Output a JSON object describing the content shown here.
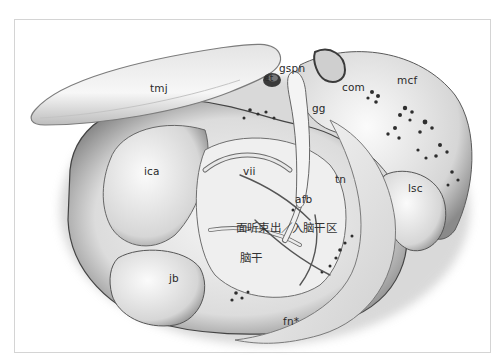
{
  "figure": {
    "type": "anatomical illustration",
    "view": "translabyrinthine / middle fossa exposure of facial-vestibulocochlear nerve at brainstem",
    "colors": {
      "background": "#ffffff",
      "frame": "#d4d4d4",
      "tissue_light": "#f2f2f2",
      "tissue_mid": "#b8b8b8",
      "tissue_dark": "#3a3a3a",
      "label_text": "#2a2a2a"
    }
  },
  "labels": {
    "tmj": "tmj",
    "gspn": "gspn",
    "et": "et",
    "gg": "gg",
    "com": "com",
    "mcf": "mcf",
    "ica": "ica",
    "vii": "vii",
    "afb": "afb",
    "tn": "tn",
    "lsc": "lsc",
    "rez": "面听束出／入脑干区",
    "brainstem": "脑干",
    "jb": "jb",
    "fn": "fn*"
  }
}
